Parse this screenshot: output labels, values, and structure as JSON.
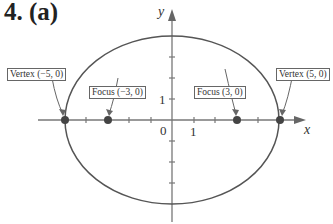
{
  "title": "4.  (a)",
  "axes": {
    "x_label": "x",
    "y_label": "y",
    "origin_label": "0",
    "x_tick_label": "1",
    "y_tick_label": "1"
  },
  "labels": {
    "vertex_left": "Vertex (−5, 0)",
    "focus_left": "Focus (−3, 0)",
    "focus_right": "Focus (3, 0)",
    "vertex_right": "Vertex (5, 0)"
  },
  "ellipse": {
    "a": 5,
    "b": 4,
    "c": 3
  },
  "colors": {
    "curve": "#555555",
    "point": "#444444"
  }
}
